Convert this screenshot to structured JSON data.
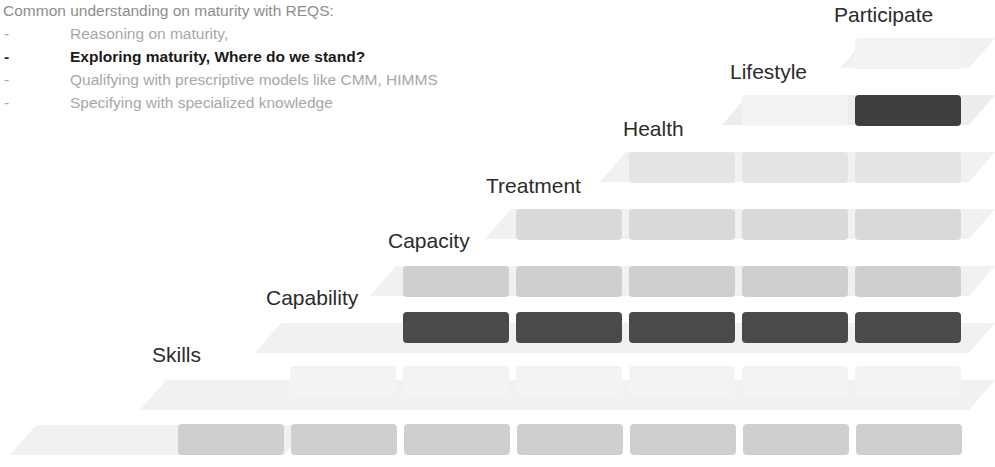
{
  "header": {
    "title": "Common understanding on maturity with REQS:",
    "bullets": [
      {
        "marker": "-",
        "text": "Reasoning on maturity,",
        "emphasis": false
      },
      {
        "marker": "-",
        "text": "Exploring maturity, Where do we stand?",
        "emphasis": true
      },
      {
        "marker": "-",
        "text": "Qualifying with prescriptive models like CMM, HIMMS",
        "emphasis": false
      },
      {
        "marker": "-",
        "text": "Specifying with specialized knowledge",
        "emphasis": false
      }
    ]
  },
  "diagram": {
    "type": "staircase-maturity-grid",
    "colors": {
      "highlight_dark": "#3f3f3f",
      "block_mid": "#c8c8c8",
      "block_light": "#d9d9d9",
      "block_faint": "#f3f3f3",
      "band_faint": "#f1f1f1",
      "label_text": "#2b2b2b",
      "header_text": "#a7a7a7",
      "emphasis_text": "#1a1a1a"
    },
    "steps": [
      {
        "label": "Participate",
        "blocks": 1,
        "highlight": false
      },
      {
        "label": "Lifestyle",
        "blocks": 2,
        "highlight": true
      },
      {
        "label": "Health",
        "blocks": 3,
        "highlight": false
      },
      {
        "label": "Treatment",
        "blocks": 4,
        "highlight": false
      },
      {
        "label": "Capacity",
        "blocks": 5,
        "highlight": false
      },
      {
        "label": "Capability",
        "blocks": 6,
        "highlight": true
      },
      {
        "label": "Skills",
        "blocks": 7,
        "highlight": false
      }
    ]
  }
}
